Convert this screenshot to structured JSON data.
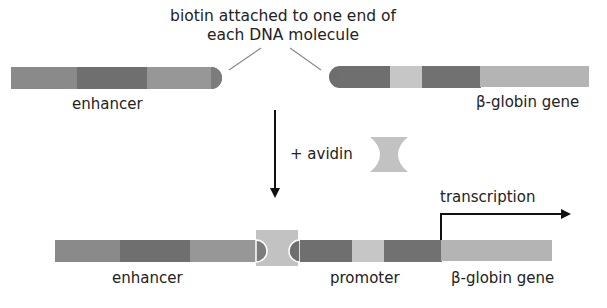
{
  "caption": {
    "line1": "biotin attached to one end of",
    "line2": "each DNA molecule"
  },
  "top_left_molecule": {
    "label": "enhancer"
  },
  "top_right_molecule": {
    "label": "β-globin gene"
  },
  "step": {
    "label": "+ avidin"
  },
  "bottom_molecule": {
    "labels": {
      "enhancer": "enhancer",
      "promoter": "promoter",
      "gene": "β-globin gene",
      "transcription": "transcription"
    }
  },
  "colors": {
    "medium": "#8a8a8a",
    "dark": "#6e6e6e",
    "medium_light": "#999999",
    "light": "#c4c4c4",
    "gene": "#b5b5b5",
    "avidin": "#c2c2c2",
    "line": "#7a7a7a",
    "arrow": "#111111"
  }
}
